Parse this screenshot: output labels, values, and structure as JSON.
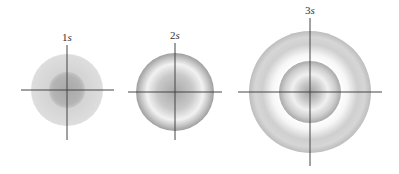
{
  "panels": [
    {
      "id": "t1",
      "label_num": "1",
      "label_unit": "s",
      "pattern": "single-blob"
    },
    {
      "id": "t2",
      "label_num": "2",
      "label_unit": "s",
      "pattern": "single-ring"
    },
    {
      "id": "t3",
      "label_num": "3",
      "label_unit": "s",
      "pattern": "double-ring"
    }
  ],
  "colors": {
    "axis": "#444444",
    "shade_dark": "#9a9a9a",
    "shade_light": "#e6e6e6",
    "background": "#ffffff"
  }
}
